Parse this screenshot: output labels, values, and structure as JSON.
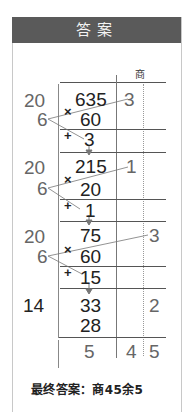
{
  "header": {
    "title": "答案"
  },
  "quotient_label": "商",
  "steps": [
    {
      "divisor": "20",
      "multiplier": "6",
      "dividend": "635",
      "product": "60",
      "op_multiply": "×",
      "op_add": "+",
      "remainder": "3",
      "quotient_digit": "3"
    },
    {
      "divisor": "20",
      "multiplier": "6",
      "dividend": "215",
      "product": "20",
      "op_multiply": "×",
      "op_add": "+",
      "remainder": "1",
      "quotient_digit": "1"
    },
    {
      "divisor": "20",
      "multiplier": "6",
      "dividend": "75",
      "product": "60",
      "op_multiply": "×",
      "op_add": "+",
      "remainder": "15",
      "quotient_digit": "3"
    },
    {
      "divisor": "14",
      "dividend": "33",
      "product": "28",
      "quotient_digit": "2"
    }
  ],
  "result_row": {
    "remainder": "5",
    "quotient_tens": "4",
    "quotient_ones": "5"
  },
  "final_answer": "最终答案：商45余5",
  "colors": {
    "header_bg": "#5a5a5a",
    "header_text": "#f4f4f4",
    "text": "#222222",
    "muted": "#666666"
  }
}
